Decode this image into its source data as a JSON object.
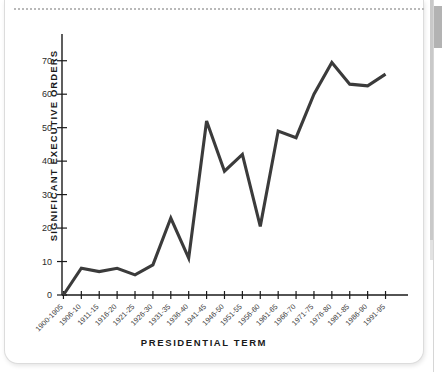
{
  "page": {
    "background_color": "#ffffff",
    "card_border_color": "#dcdcdc"
  },
  "scrollbar": {
    "thumb_color": "#b3b3b3",
    "track_color": "#ffffff"
  },
  "chart_data": {
    "type": "line",
    "title": "",
    "xlabel": "PRESIDENTIAL TERM",
    "ylabel": "SIGNIFICANT EXECUTIVE ORDERS",
    "ylim": [
      0,
      75
    ],
    "ytick_values": [
      0,
      10,
      20,
      30,
      40,
      50,
      60,
      70
    ],
    "ytick_labels": [
      "0",
      "10",
      "20",
      "30",
      "40",
      "50",
      "60",
      "70"
    ],
    "grid": false,
    "legend": "none",
    "line_color": "#3b3b3b",
    "categories": [
      "1900-1905",
      "1906-10",
      "1911-15",
      "1916-20",
      "1921-25",
      "1926-30",
      "1931-35",
      "1936-40",
      "1941-45",
      "1946-50",
      "1951-55",
      "1956-60",
      "1961-65",
      "1966-70",
      "1971-75",
      "1976-80",
      "1981-85",
      "1986-90",
      "1991-95"
    ],
    "values": [
      0,
      8,
      7,
      8,
      6,
      9,
      23,
      11,
      52,
      37,
      42,
      20.5,
      49,
      47,
      60,
      69.5,
      63,
      62.5,
      66
    ]
  }
}
